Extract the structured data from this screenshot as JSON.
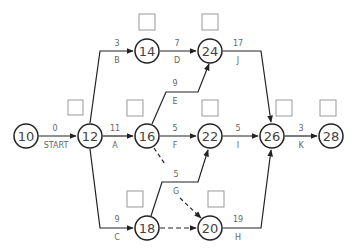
{
  "diagram": {
    "type": "activity-on-arrow network",
    "colors": {
      "line": "#222222",
      "text": "#666666",
      "box": "#999999",
      "background": "#ffffff"
    },
    "nodes": [
      {
        "id": "10",
        "label": "10",
        "x": 26,
        "y": 136,
        "box": false
      },
      {
        "id": "12",
        "label": "12",
        "x": 90,
        "y": 136,
        "box": true
      },
      {
        "id": "14",
        "label": "14",
        "x": 147,
        "y": 51,
        "box": true
      },
      {
        "id": "24",
        "label": "24",
        "x": 210,
        "y": 51,
        "box": true
      },
      {
        "id": "16",
        "label": "16",
        "x": 147,
        "y": 136,
        "box": true
      },
      {
        "id": "22",
        "label": "22",
        "x": 210,
        "y": 136,
        "box": true
      },
      {
        "id": "26",
        "label": "26",
        "x": 272,
        "y": 136,
        "box": true
      },
      {
        "id": "28",
        "label": "28",
        "x": 331,
        "y": 136,
        "box": true
      },
      {
        "id": "18",
        "label": "18",
        "x": 147,
        "y": 228,
        "box": true
      },
      {
        "id": "20",
        "label": "20",
        "x": 210,
        "y": 228,
        "box": true
      }
    ],
    "edges": [
      {
        "from": "10",
        "to": "12",
        "activity": "START",
        "duration": "0",
        "dashed": false
      },
      {
        "from": "12",
        "to": "14",
        "activity": "B",
        "duration": "3",
        "dashed": false
      },
      {
        "from": "12",
        "to": "16",
        "activity": "A",
        "duration": "11",
        "dashed": false
      },
      {
        "from": "12",
        "to": "18",
        "activity": "C",
        "duration": "9",
        "dashed": false
      },
      {
        "from": "14",
        "to": "24",
        "activity": "D",
        "duration": "7",
        "dashed": false
      },
      {
        "from": "16",
        "to": "24",
        "activity": "E",
        "duration": "9",
        "dashed": false
      },
      {
        "from": "16",
        "to": "22",
        "activity": "F",
        "duration": "5",
        "dashed": false
      },
      {
        "from": "16",
        "to": "20",
        "activity": "",
        "duration": "",
        "dashed": true
      },
      {
        "from": "18",
        "to": "22",
        "activity": "G",
        "duration": "5",
        "dashed": false
      },
      {
        "from": "18",
        "to": "20",
        "activity": "",
        "duration": "",
        "dashed": true
      },
      {
        "from": "24",
        "to": "26",
        "activity": "J",
        "duration": "17",
        "dashed": false
      },
      {
        "from": "22",
        "to": "26",
        "activity": "I",
        "duration": "5",
        "dashed": false
      },
      {
        "from": "20",
        "to": "26",
        "activity": "H",
        "duration": "19",
        "dashed": false
      },
      {
        "from": "26",
        "to": "28",
        "activity": "K",
        "duration": "3",
        "dashed": false
      }
    ]
  },
  "labels": {
    "n10": "10",
    "n12": "12",
    "n14": "14",
    "n24": "24",
    "n16": "16",
    "n22": "22",
    "n26": "26",
    "n28": "28",
    "n18": "18",
    "n20": "20",
    "start_dur": "0",
    "start_act": "START",
    "b_dur": "3",
    "b_act": "B",
    "a_dur": "11",
    "a_act": "A",
    "c_dur": "9",
    "c_act": "C",
    "d_dur": "7",
    "d_act": "D",
    "e_dur": "9",
    "e_act": "E",
    "f_dur": "5",
    "f_act": "F",
    "g_dur": "5",
    "g_act": "G",
    "j_dur": "17",
    "j_act": "J",
    "i_dur": "5",
    "i_act": "I",
    "h_dur": "19",
    "h_act": "H",
    "k_dur": "3",
    "k_act": "K"
  }
}
